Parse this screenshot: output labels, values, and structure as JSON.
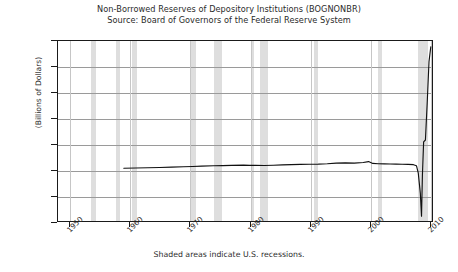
{
  "chart_data": {
    "type": "line",
    "title": "Non-Borrowed Reserves of Depository Institutions (BOGNONBR)",
    "subtitle": "Source: Board of Governors of the Federal Reserve System",
    "xlabel": "",
    "ylabel": "(Billions of Dollars)",
    "footnote": "Shaded areas indicate U.S. recessions.",
    "grid": true,
    "legend": "none",
    "xlim": [
      1948,
      2010.5
    ],
    "ylim": [
      -400,
      1000
    ],
    "ytick_values": [
      1000,
      800,
      600,
      400,
      200,
      0,
      -200,
      -400
    ],
    "ytick_labels": [
      "1,000",
      "800",
      "600",
      "400",
      "200",
      "0",
      "-200",
      "-400"
    ],
    "xtick_values": [
      1950,
      1960,
      1970,
      1980,
      1990,
      2000,
      2010
    ],
    "xtick_labels": [
      "1950",
      "1960",
      "1970",
      "1980",
      "1990",
      "2000",
      "2010"
    ],
    "line_color": "#111111",
    "band_color": "#dedede",
    "grid_color": "#9a9a9a",
    "series": [
      {
        "name": "Non-Borrowed Reserves",
        "x": [
          1959.0,
          1961.0,
          1963.0,
          1965.0,
          1967.0,
          1969.0,
          1970.5,
          1972.0,
          1974.0,
          1975.5,
          1977.0,
          1979.0,
          1980.0,
          1981.0,
          1982.5,
          1984.0,
          1985.5,
          1987.0,
          1988.5,
          1990.0,
          1991.5,
          1993.0,
          1994.5,
          1996.0,
          1997.5,
          1999.0,
          1999.9,
          2000.6,
          2001.5,
          2002.5,
          2003.5,
          2004.5,
          2005.5,
          2006.5,
          2007.4,
          2007.9,
          2008.2,
          2008.55,
          2008.75,
          2008.9,
          2009.1,
          2009.4,
          2009.7,
          2010.0,
          2010.3
        ],
        "y": [
          10,
          12,
          14,
          16,
          19,
          22,
          24,
          27,
          30,
          31,
          33,
          35,
          33,
          34,
          32,
          34,
          37,
          39,
          40,
          41,
          42,
          45,
          50,
          52,
          50,
          55,
          62,
          48,
          45,
          44,
          43,
          42,
          41,
          40,
          38,
          30,
          -25,
          -185,
          -362,
          -40,
          215,
          230,
          520,
          840,
          955
        ]
      }
    ],
    "recessions": [
      {
        "start": 1953.5,
        "end": 1954.4
      },
      {
        "start": 1957.6,
        "end": 1958.3
      },
      {
        "start": 1960.3,
        "end": 1961.2
      },
      {
        "start": 1969.9,
        "end": 1970.9
      },
      {
        "start": 1973.9,
        "end": 1975.2
      },
      {
        "start": 1980.1,
        "end": 1980.5
      },
      {
        "start": 1981.5,
        "end": 1982.9
      },
      {
        "start": 1990.5,
        "end": 1991.2
      },
      {
        "start": 2001.2,
        "end": 2001.9
      },
      {
        "start": 2007.9,
        "end": 2009.5
      }
    ]
  }
}
